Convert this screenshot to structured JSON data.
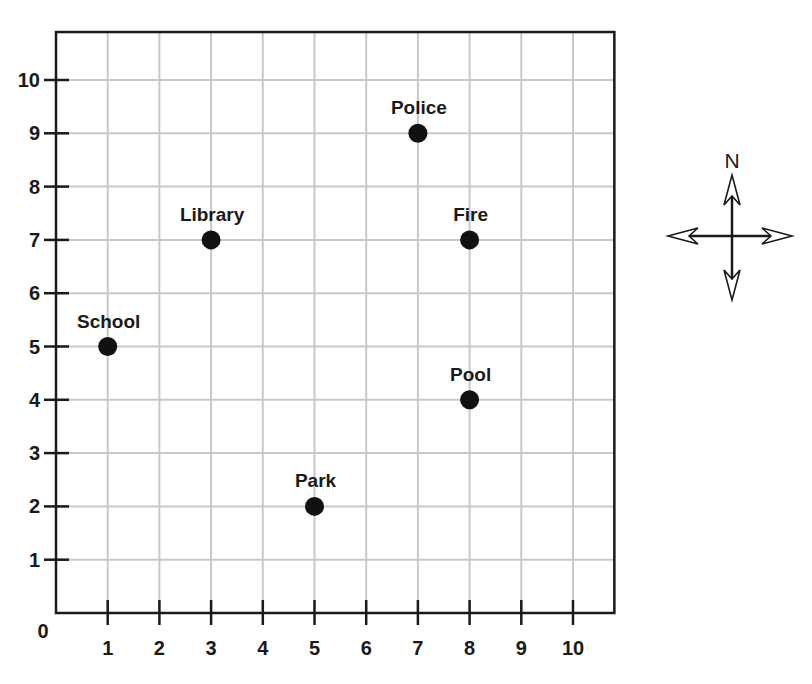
{
  "chart_data": {
    "type": "scatter",
    "title": "",
    "xlabel": "",
    "ylabel": "",
    "origin_label": "0",
    "x_ticks": [
      1,
      2,
      3,
      4,
      5,
      6,
      7,
      8,
      9,
      10
    ],
    "y_ticks": [
      1,
      2,
      3,
      4,
      5,
      6,
      7,
      8,
      9,
      10
    ],
    "xlim": [
      0,
      10.8
    ],
    "ylim": [
      0,
      10.9
    ],
    "grid": true,
    "legend": null,
    "points": [
      {
        "label": "Police",
        "x": 7,
        "y": 9
      },
      {
        "label": "Library",
        "x": 3,
        "y": 7
      },
      {
        "label": "Fire",
        "x": 8,
        "y": 7
      },
      {
        "label": "School",
        "x": 1,
        "y": 5
      },
      {
        "label": "Pool",
        "x": 8,
        "y": 4
      },
      {
        "label": "Park",
        "x": 5,
        "y": 2
      }
    ],
    "compass": {
      "label": "N",
      "directions": [
        "north",
        "south",
        "east",
        "west"
      ]
    }
  },
  "colors": {
    "grid": "#c8c8c8",
    "axis": "#1a1a1a",
    "point": "#111111",
    "background": "#ffffff"
  }
}
